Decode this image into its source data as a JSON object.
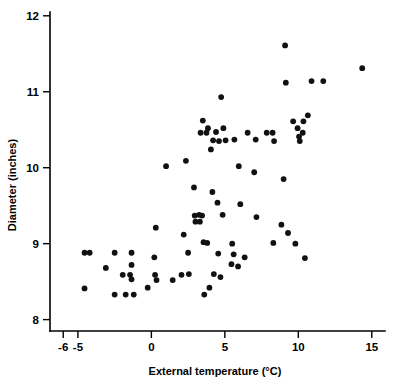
{
  "chart_data": {
    "type": "scatter",
    "title": "",
    "xlabel": "External temperature (°C)",
    "ylabel": "Diameter (inches)",
    "xlim": [
      -6.9,
      15.9
    ],
    "ylim": [
      7.85,
      12.05
    ],
    "xticks": [
      -6,
      -5,
      0,
      5,
      10,
      15
    ],
    "xticklabels": [
      "-6",
      "-5",
      "0",
      "5",
      "10",
      "15"
    ],
    "yticks": [
      8,
      9,
      10,
      11,
      12
    ],
    "yticklabels": [
      "8",
      "9",
      "10",
      "11",
      "12"
    ],
    "grid": false,
    "legend": null,
    "marker": "filled-circle",
    "marker_color": "#111111",
    "series": [
      {
        "name": "observations",
        "points": [
          [
            -4.55,
            8.88
          ],
          [
            -4.2,
            8.88
          ],
          [
            -4.55,
            8.41
          ],
          [
            -3.1,
            8.68
          ],
          [
            -2.5,
            8.88
          ],
          [
            -2.5,
            8.33
          ],
          [
            -1.95,
            8.59
          ],
          [
            -1.75,
            8.33
          ],
          [
            -1.45,
            8.59
          ],
          [
            -1.35,
            8.88
          ],
          [
            -1.35,
            8.72
          ],
          [
            -1.35,
            8.53
          ],
          [
            -1.2,
            8.33
          ],
          [
            -0.25,
            8.42
          ],
          [
            0.2,
            8.82
          ],
          [
            0.25,
            8.59
          ],
          [
            0.3,
            9.21
          ],
          [
            0.35,
            8.52
          ],
          [
            1.0,
            10.02
          ],
          [
            1.45,
            8.52
          ],
          [
            2.05,
            8.59
          ],
          [
            2.2,
            9.12
          ],
          [
            2.35,
            10.09
          ],
          [
            2.5,
            8.88
          ],
          [
            2.55,
            8.6
          ],
          [
            2.9,
            9.74
          ],
          [
            2.95,
            9.37
          ],
          [
            3.0,
            9.29
          ],
          [
            3.25,
            9.38
          ],
          [
            3.3,
            9.29
          ],
          [
            3.35,
            10.46
          ],
          [
            3.45,
            9.37
          ],
          [
            3.5,
            10.62
          ],
          [
            3.55,
            9.02
          ],
          [
            3.6,
            8.33
          ],
          [
            3.75,
            10.46
          ],
          [
            3.8,
            9.01
          ],
          [
            3.85,
            10.52
          ],
          [
            3.95,
            8.42
          ],
          [
            4.05,
            10.24
          ],
          [
            4.15,
            9.68
          ],
          [
            4.2,
            10.36
          ],
          [
            4.25,
            8.6
          ],
          [
            4.4,
            10.47
          ],
          [
            4.5,
            9.54
          ],
          [
            4.55,
            8.87
          ],
          [
            4.6,
            10.35
          ],
          [
            4.7,
            8.56
          ],
          [
            4.75,
            10.93
          ],
          [
            4.85,
            9.38
          ],
          [
            4.9,
            10.52
          ],
          [
            5.05,
            10.36
          ],
          [
            5.45,
            8.73
          ],
          [
            5.5,
            9.0
          ],
          [
            5.6,
            8.86
          ],
          [
            5.65,
            10.37
          ],
          [
            5.9,
            8.7
          ],
          [
            5.95,
            10.02
          ],
          [
            6.05,
            9.52
          ],
          [
            6.35,
            8.82
          ],
          [
            6.55,
            10.46
          ],
          [
            7.0,
            9.94
          ],
          [
            7.1,
            10.37
          ],
          [
            7.15,
            9.35
          ],
          [
            7.85,
            10.46
          ],
          [
            8.25,
            10.46
          ],
          [
            8.3,
            9.01
          ],
          [
            8.35,
            10.35
          ],
          [
            8.85,
            9.25
          ],
          [
            9.0,
            9.85
          ],
          [
            9.1,
            11.61
          ],
          [
            9.15,
            11.12
          ],
          [
            9.3,
            9.14
          ],
          [
            9.65,
            10.61
          ],
          [
            9.8,
            9.0
          ],
          [
            9.95,
            10.52
          ],
          [
            10.05,
            10.41
          ],
          [
            10.1,
            10.35
          ],
          [
            10.3,
            10.46
          ],
          [
            10.35,
            10.61
          ],
          [
            10.45,
            8.81
          ],
          [
            10.65,
            10.69
          ],
          [
            10.9,
            11.14
          ],
          [
            11.7,
            11.14
          ],
          [
            14.35,
            11.31
          ]
        ]
      }
    ]
  },
  "axes": {
    "y_axis_label": "Diameter (inches)",
    "x_axis_label": "External temperature (°C)"
  }
}
